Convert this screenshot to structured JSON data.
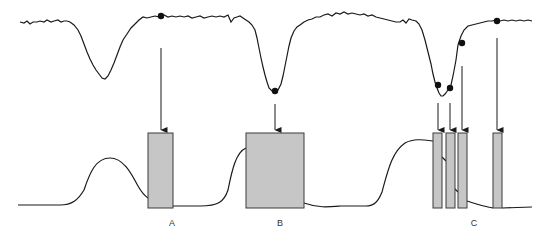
{
  "diagram": {
    "type": "signal-to-sampling-illustration",
    "colors": {
      "trace": "#1a1a1a",
      "bar_fill": "#c6c6c6",
      "bar_stroke": "#3a3a3a",
      "dot": "#111111",
      "background": "#ffffff"
    },
    "groups": [
      {
        "label": "A",
        "bars": 1,
        "note": "single sample taken after first dip (on baseline)"
      },
      {
        "label": "B",
        "bars": 1,
        "note": "single wide sample at minimum of second dip"
      },
      {
        "label": "C",
        "bars": 4,
        "note": "four narrow samples across third dip and recovery"
      }
    ],
    "top_trace": {
      "description": "noisy signal with three downward dips",
      "dips": 3,
      "markers": 6
    },
    "labels": {
      "a": "A",
      "b": "B",
      "c": "C"
    }
  }
}
